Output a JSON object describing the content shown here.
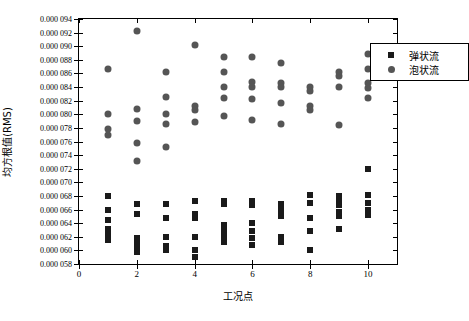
{
  "chart_data": {
    "type": "scatter",
    "title": "",
    "xlabel": "工况点",
    "ylabel": "均方根值(RMS)",
    "xlim": [
      0,
      11
    ],
    "ylim": [
      5.8e-05,
      9.4e-05
    ],
    "grid": false,
    "legend_position": "top-right",
    "xticks": [
      "0",
      "2",
      "4",
      "6",
      "8",
      "10"
    ],
    "xtick_values": [
      0,
      2,
      4,
      6,
      8,
      10
    ],
    "yticks": [
      "0.000 058",
      "0.000 060",
      "0.000 062",
      "0.000 064",
      "0.000 066",
      "0.000 068",
      "0.000 070",
      "0.000 072",
      "0.000 074",
      "0.000 076",
      "0.000 078",
      "0.000 080",
      "0.000 082",
      "0.000 084",
      "0.000 086",
      "0.000 088",
      "0.000 090",
      "0.000 092",
      "0.000 094"
    ],
    "ytick_values": [
      5.8e-05,
      6e-05,
      6.2e-05,
      6.4e-05,
      6.6e-05,
      6.8e-05,
      7e-05,
      7.2e-05,
      7.4e-05,
      7.6e-05,
      7.8e-05,
      8e-05,
      8.2e-05,
      8.4e-05,
      8.6e-05,
      8.8e-05,
      9e-05,
      9.2e-05,
      9.4e-05
    ],
    "series": [
      {
        "name": "弹状流",
        "marker": "square",
        "color": "#1a1a1a",
        "points": [
          [
            1,
            6.8e-05
          ],
          [
            1,
            6.6e-05
          ],
          [
            1,
            6.45e-05
          ],
          [
            1,
            6.32e-05
          ],
          [
            1,
            6.24e-05
          ],
          [
            1,
            6.16e-05
          ],
          [
            2,
            6.68e-05
          ],
          [
            2,
            6.54e-05
          ],
          [
            2,
            6.18e-05
          ],
          [
            2,
            6.1e-05
          ],
          [
            2,
            6.04e-05
          ],
          [
            2,
            5.98e-05
          ],
          [
            3,
            6.68e-05
          ],
          [
            3,
            6.48e-05
          ],
          [
            3,
            6.2e-05
          ],
          [
            3,
            6.06e-05
          ],
          [
            3,
            6e-05
          ],
          [
            4,
            6.72e-05
          ],
          [
            4,
            6.54e-05
          ],
          [
            4,
            6.48e-05
          ],
          [
            4,
            6.2e-05
          ],
          [
            4,
            6e-05
          ],
          [
            4,
            5.9e-05
          ],
          [
            5,
            6.72e-05
          ],
          [
            5,
            6.68e-05
          ],
          [
            5,
            6.38e-05
          ],
          [
            5,
            6.28e-05
          ],
          [
            5,
            6.2e-05
          ],
          [
            5,
            6.12e-05
          ],
          [
            6,
            6.72e-05
          ],
          [
            6,
            6.66e-05
          ],
          [
            6,
            6.4e-05
          ],
          [
            6,
            6.28e-05
          ],
          [
            6,
            6.18e-05
          ],
          [
            6,
            6.08e-05
          ],
          [
            7,
            6.68e-05
          ],
          [
            7,
            6.6e-05
          ],
          [
            7,
            6.5e-05
          ],
          [
            7,
            6.2e-05
          ],
          [
            7,
            6.12e-05
          ],
          [
            8,
            6.82e-05
          ],
          [
            8,
            6.7e-05
          ],
          [
            8,
            6.48e-05
          ],
          [
            8,
            6.28e-05
          ],
          [
            8,
            6e-05
          ],
          [
            9,
            6.8e-05
          ],
          [
            9,
            6.72e-05
          ],
          [
            9,
            6.66e-05
          ],
          [
            9,
            6.56e-05
          ],
          [
            9,
            6.5e-05
          ],
          [
            9,
            6.32e-05
          ],
          [
            10,
            7.2e-05
          ],
          [
            10,
            6.82e-05
          ],
          [
            10,
            6.7e-05
          ],
          [
            10,
            6.6e-05
          ],
          [
            10,
            6.52e-05
          ]
        ]
      },
      {
        "name": "泡状流",
        "marker": "circle",
        "color": "#555555",
        "points": [
          [
            1,
            8.66e-05
          ],
          [
            1,
            8e-05
          ],
          [
            1,
            7.78e-05
          ],
          [
            1,
            7.7e-05
          ],
          [
            2,
            9.22e-05
          ],
          [
            2,
            8.08e-05
          ],
          [
            2,
            7.9e-05
          ],
          [
            2,
            7.58e-05
          ],
          [
            2,
            7.32e-05
          ],
          [
            3,
            8.62e-05
          ],
          [
            3,
            8.26e-05
          ],
          [
            3,
            8e-05
          ],
          [
            3,
            7.86e-05
          ],
          [
            3,
            7.52e-05
          ],
          [
            4,
            9.02e-05
          ],
          [
            4,
            8.12e-05
          ],
          [
            4,
            8.06e-05
          ],
          [
            4,
            7.88e-05
          ],
          [
            5,
            8.84e-05
          ],
          [
            5,
            8.62e-05
          ],
          [
            5,
            8.4e-05
          ],
          [
            5,
            8.24e-05
          ],
          [
            5,
            7.98e-05
          ],
          [
            6,
            8.84e-05
          ],
          [
            6,
            8.48e-05
          ],
          [
            6,
            8.4e-05
          ],
          [
            6,
            8.22e-05
          ],
          [
            6,
            7.92e-05
          ],
          [
            7,
            8.76e-05
          ],
          [
            7,
            8.46e-05
          ],
          [
            7,
            8.4e-05
          ],
          [
            7,
            8.16e-05
          ],
          [
            7,
            7.86e-05
          ],
          [
            8,
            8.4e-05
          ],
          [
            8,
            8.34e-05
          ],
          [
            8,
            8.12e-05
          ],
          [
            8,
            8.06e-05
          ],
          [
            9,
            8.62e-05
          ],
          [
            9,
            8.56e-05
          ],
          [
            9,
            8.4e-05
          ],
          [
            9,
            7.84e-05
          ],
          [
            10,
            8.88e-05
          ],
          [
            10,
            8.66e-05
          ],
          [
            10,
            8.46e-05
          ],
          [
            10,
            8.38e-05
          ],
          [
            10,
            8.24e-05
          ]
        ]
      }
    ]
  }
}
